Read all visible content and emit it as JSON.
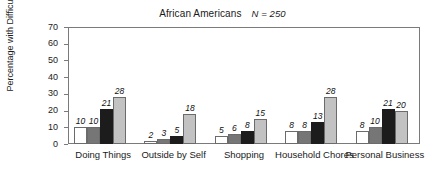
{
  "chart_data": {
    "type": "bar",
    "title": "African Americans",
    "annotation": "N = 250",
    "xlabel": "",
    "ylabel": "Percentage with Difficulty",
    "ylim": [
      0,
      70
    ],
    "yticks": [
      0,
      10,
      20,
      30,
      40,
      50,
      60,
      70
    ],
    "ytick_labels": [
      "0",
      "10",
      "20",
      "30",
      "40",
      "50",
      "60",
      "70"
    ],
    "grid": false,
    "legend": "none",
    "categories": [
      "Doing Things",
      "Outside by Self",
      "Shopping",
      "Household Chores",
      "Personal Business"
    ],
    "series": [
      {
        "name": "series-1",
        "color": "#ffffff",
        "values": [
          10,
          2,
          5,
          8,
          8
        ]
      },
      {
        "name": "series-2",
        "color": "#767676",
        "values": [
          10,
          3,
          6,
          8,
          10
        ]
      },
      {
        "name": "series-3",
        "color": "#1c1c1c",
        "values": [
          21,
          5,
          8,
          13,
          21
        ]
      },
      {
        "name": "series-4",
        "color": "#c2c2c2",
        "values": [
          28,
          18,
          15,
          28,
          20
        ]
      }
    ],
    "data_labels": [
      [
        "10",
        "10",
        "21",
        "28"
      ],
      [
        "2",
        "3",
        "5",
        "18"
      ],
      [
        "5",
        "6",
        "8",
        "15"
      ],
      [
        "8",
        "8",
        "13",
        "28"
      ],
      [
        "8",
        "10",
        "21",
        "20"
      ]
    ]
  }
}
